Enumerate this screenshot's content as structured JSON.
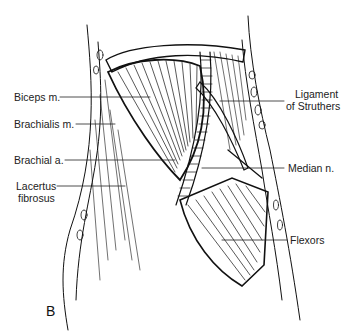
{
  "figure": {
    "panel_letter": "B",
    "labels_left": [
      {
        "id": "biceps",
        "text": "Biceps m."
      },
      {
        "id": "brachialis",
        "text": "Brachialis m."
      },
      {
        "id": "brachial-artery",
        "text": "Brachial a."
      },
      {
        "id": "lacertus",
        "line1": "Lacertus",
        "line2": "fibrosus"
      }
    ],
    "labels_right": [
      {
        "id": "struthers",
        "line1": "Ligament",
        "line2": "of Struthers"
      },
      {
        "id": "median-nerve",
        "text": "Median n."
      },
      {
        "id": "flexors",
        "text": "Flexors"
      }
    ]
  }
}
